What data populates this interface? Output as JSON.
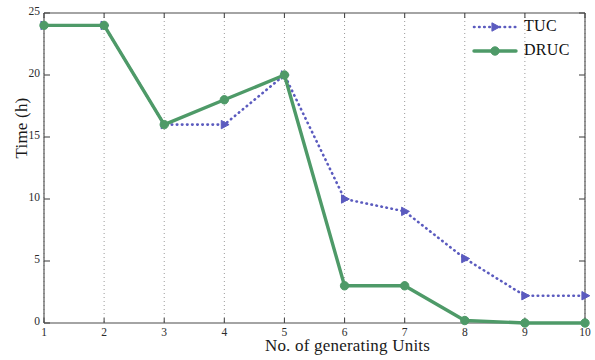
{
  "chart_data": {
    "type": "line",
    "title": "",
    "xlabel": "No. of generating Units",
    "ylabel": "Time (h)",
    "x": [
      1,
      2,
      3,
      4,
      5,
      6,
      7,
      8,
      9,
      10
    ],
    "xlim": [
      1,
      10
    ],
    "ylim": [
      0,
      25
    ],
    "xticks": [
      "1",
      "2",
      "3",
      "4",
      "5",
      "6",
      "7",
      "8",
      "9",
      "10"
    ],
    "yticks": [
      "0",
      "5",
      "10",
      "15",
      "20",
      "25"
    ],
    "grid": "vertical-dotted",
    "legend_position": "upper-right",
    "series": [
      {
        "name": "TUC",
        "values": [
          24,
          24,
          16,
          16,
          20,
          10,
          9,
          5.2,
          2.2,
          2.2
        ],
        "color": "#5b5bbf",
        "line_style": "dotted",
        "marker": "triangle-right"
      },
      {
        "name": "DRUC",
        "values": [
          24,
          24,
          16,
          18,
          20,
          3,
          3,
          0.2,
          0,
          0
        ],
        "color": "#4e9a68",
        "line_style": "solid",
        "marker": "circle"
      }
    ]
  },
  "legend": {
    "entries": [
      {
        "label": "TUC"
      },
      {
        "label": "DRUC"
      }
    ]
  }
}
